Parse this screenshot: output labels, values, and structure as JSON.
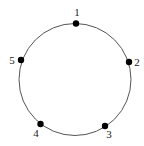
{
  "diagram": {
    "type": "cycle",
    "circle": {
      "cx": 75,
      "cy": 79.5,
      "r": 56,
      "stroke": "#555555"
    },
    "node_color": "#000000",
    "nodes": [
      {
        "id": "1",
        "label": "1",
        "x": 76,
        "y": 23.5,
        "lx": 77,
        "ly": 16
      },
      {
        "id": "2",
        "label": "2",
        "x": 129,
        "y": 62,
        "lx": 137,
        "ly": 66
      },
      {
        "id": "3",
        "label": "3",
        "x": 105,
        "y": 126,
        "lx": 109,
        "ly": 138
      },
      {
        "id": "4",
        "label": "4",
        "x": 40.5,
        "y": 124,
        "lx": 36,
        "ly": 137
      },
      {
        "id": "5",
        "label": "5",
        "x": 21,
        "y": 60,
        "lx": 12,
        "ly": 64
      }
    ]
  }
}
